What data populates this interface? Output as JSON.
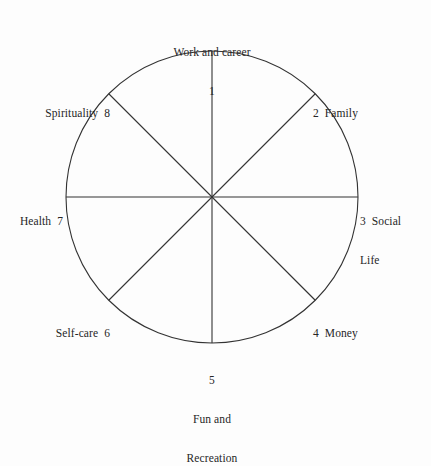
{
  "diagram": {
    "type": "radial-sector-wheel",
    "geometry": {
      "center_x": 212,
      "center_y": 197,
      "radius": 146,
      "sectors": 8,
      "stroke_color": "#333333",
      "stroke_width": 1.1,
      "background_color": "#fdfdfd"
    },
    "sectors": [
      {
        "number": "1",
        "label": "Work and career",
        "text": "Work and career",
        "number_text": "1",
        "angle_deg": 90,
        "anchor": "top"
      },
      {
        "number": "2",
        "label": "Family",
        "text": "2  Family",
        "angle_deg": 45,
        "anchor": "upper-right"
      },
      {
        "number": "3",
        "label": "Social Life",
        "line1": "3  Social",
        "line2": "Life",
        "angle_deg": 0,
        "anchor": "right"
      },
      {
        "number": "4",
        "label": "Money",
        "text": "4  Money",
        "angle_deg": -45,
        "anchor": "lower-right"
      },
      {
        "number": "5",
        "label": "Fun and Recreation",
        "number_text": "5",
        "line1": "Fun and",
        "line2": "Recreation",
        "angle_deg": -90,
        "anchor": "bottom"
      },
      {
        "number": "6",
        "label": "Self-care",
        "text": "Self-care  6",
        "angle_deg": -135,
        "anchor": "lower-left"
      },
      {
        "number": "7",
        "label": "Health",
        "text": "Health  7",
        "angle_deg": 180,
        "anchor": "left"
      },
      {
        "number": "8",
        "label": "Spirituality",
        "text": "Spirituality  8",
        "angle_deg": 135,
        "anchor": "upper-left"
      }
    ]
  }
}
